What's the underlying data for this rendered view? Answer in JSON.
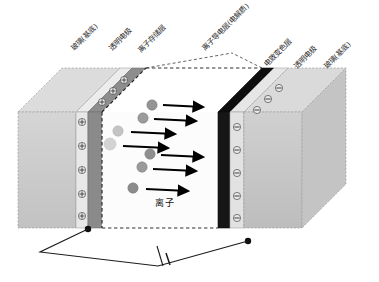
{
  "diagram": {
    "type": "electrochromic-device-cross-section",
    "background_color": "#ffffff"
  },
  "labels": [
    {
      "id": "glass-left",
      "text": "玻璃(基底)",
      "x": 72,
      "y": 46,
      "rotate": -45
    },
    {
      "id": "electrode-left",
      "text": "透明电极",
      "x": 110,
      "y": 46,
      "rotate": -45
    },
    {
      "id": "ion-storage",
      "text": "离子存储层",
      "x": 139,
      "y": 48,
      "rotate": -45
    },
    {
      "id": "ion-conductor",
      "text": "离子导电层(电解质)",
      "x": 203,
      "y": 46,
      "rotate": -45
    },
    {
      "id": "electrochromic",
      "text": "电致变色层",
      "x": 265,
      "y": 62,
      "rotate": -45
    },
    {
      "id": "electrode-right",
      "text": "透明电极",
      "x": 295,
      "y": 64,
      "rotate": -45
    },
    {
      "id": "glass-right",
      "text": "玻璃(基底)",
      "x": 325,
      "y": 64,
      "rotate": -45
    }
  ],
  "ion_label": {
    "text": "离子",
    "x": 155,
    "y": 200
  },
  "layers": [
    {
      "name": "玻璃(基底)",
      "role": "glass-substrate-left",
      "color": "#c9c9c9"
    },
    {
      "name": "透明电极",
      "role": "transparent-electrode-left",
      "color": "#e3e3e3"
    },
    {
      "name": "离子存储层",
      "role": "ion-storage-layer",
      "color": "#9a9a9a"
    },
    {
      "name": "离子导电层(电解质)",
      "role": "ion-conducting-electrolyte",
      "color": "#fdfdfd"
    },
    {
      "name": "电致变色层",
      "role": "electrochromic-layer",
      "color": "#1a1a1a"
    },
    {
      "name": "透明电极",
      "role": "transparent-electrode-right",
      "color": "#d8d8d8"
    },
    {
      "name": "玻璃(基底)",
      "role": "glass-substrate-right",
      "color": "#c4c4c4"
    }
  ],
  "charges": {
    "positive_symbol": "+",
    "negative_symbol": "-",
    "positive_count": 8,
    "negative_count": 8,
    "positive_side": "left-electrode",
    "negative_side": "right-electrode"
  },
  "ions": {
    "symbol": "sphere",
    "count": 7,
    "color": "#8f8f8f",
    "direction": "left-to-right",
    "arrow_count": 7,
    "arrow_color": "#000000"
  },
  "circuit": {
    "battery_symbol": "battery",
    "terminal_left": {
      "x": 88,
      "y": 229
    },
    "terminal_right": {
      "x": 248,
      "y": 241
    },
    "wire_color": "#1a1a1a"
  },
  "colors": {
    "glass": "#c9c9c9",
    "electrode": "#e0e0e0",
    "ion_storage": "#9a9a9a",
    "electrolyte": "#fdfdfd",
    "electrochromic": "#1a1a1a",
    "ion": "#8f8f8f",
    "outline": "#8a8a8a",
    "text": "#2b2b2b"
  }
}
